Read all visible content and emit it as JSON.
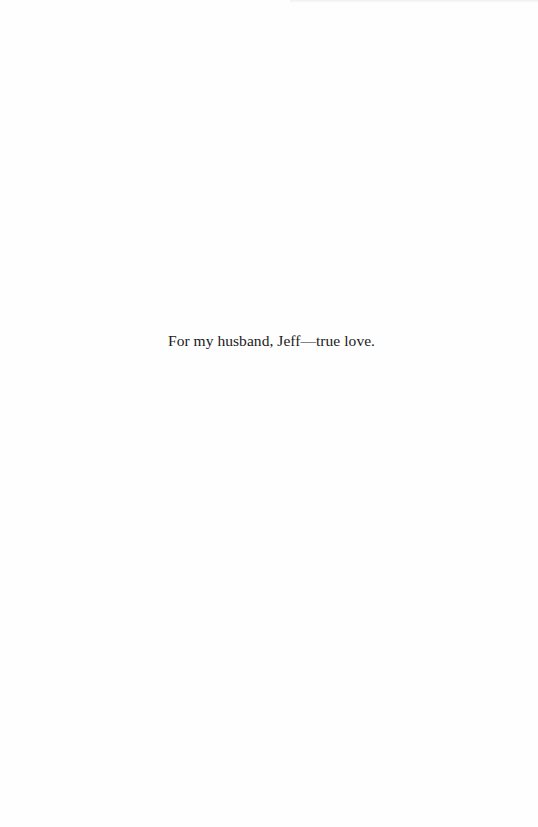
{
  "page": {
    "type": "dedication",
    "dedication_text": "For my husband, Jeff—true love."
  },
  "colors": {
    "background": "#fefefe",
    "text": "#1a1a1a"
  }
}
